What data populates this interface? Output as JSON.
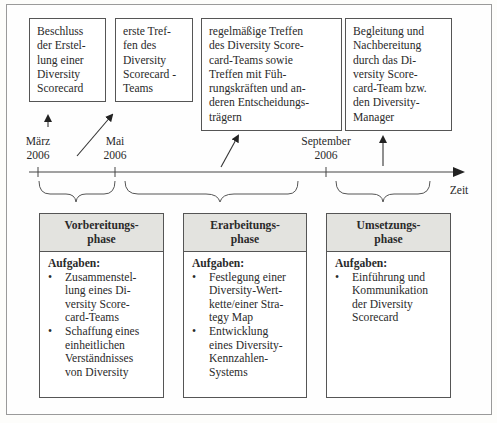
{
  "diagram": {
    "type": "timeline",
    "axis_label": "Zeit",
    "milestones": [
      {
        "id": "maerz",
        "label": "März\n2006"
      },
      {
        "id": "mai",
        "label": "Mai\n2006"
      },
      {
        "id": "september",
        "label": "September\n2006"
      }
    ],
    "events": [
      {
        "text": "Beschluss\nder Erstel-\nlung einer\nDiversity\nScorecard"
      },
      {
        "text": "erste Tref-\nfen des\nDiversity\nScorecard -\nTeams"
      },
      {
        "text": "regelmäßige Treffen\ndes Diversity Score-\ncard-Teams sowie\nTreffen mit Füh-\nrungskräften und an-\nderen Entscheidungs-\nträgern"
      },
      {
        "text": "Begleitung und\nNachbereitung\ndurch das Di-\nversity Score-\ncard-Team bzw.\nden Diversity-\nManager"
      }
    ],
    "phases": [
      {
        "title": "Vorbereitungs-\nphase",
        "tasks_label": "Aufgaben:",
        "bullet": "•",
        "tasks": [
          "Zusammenstel-\nlung eines Di-\nversity Score-\ncard-Teams",
          "Schaffung eines\neinheitlichen\nVerständnisses\nvon Diversity"
        ]
      },
      {
        "title": "Erarbeitungs-\nphase",
        "tasks_label": "Aufgaben:",
        "bullet": "•",
        "tasks": [
          "Festlegung einer\nDiversity-Wert-\nkette/einer Stra-\ntegy Map",
          "Entwicklung\neines Diversity-\nKennzahlen-\nSystems"
        ]
      },
      {
        "title": "Umsetzungs-\nphase",
        "tasks_label": "Aufgaben:",
        "bullet": "•",
        "tasks": [
          "Einführung und\nKommunikation\nder Diversity\nScorecard"
        ]
      }
    ],
    "colors": {
      "line": "#444444",
      "phase_header_bg": "#e3e3df",
      "frame": "#9a9a9a"
    }
  }
}
